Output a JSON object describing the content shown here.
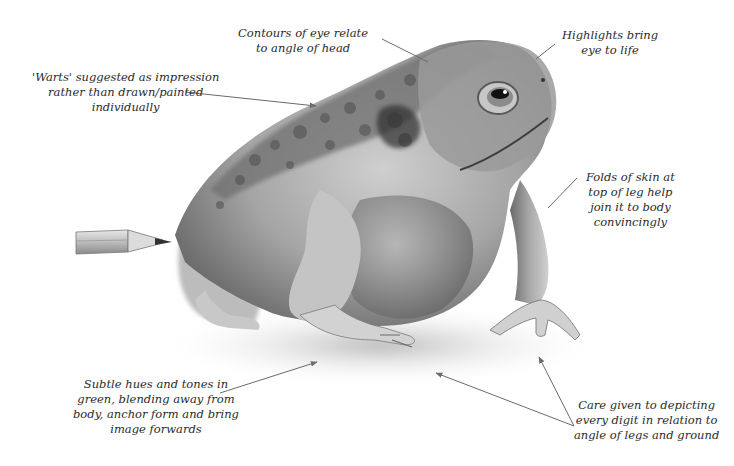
{
  "annotations": {
    "eye_contours": {
      "lines": [
        "Contours of eye relate",
        "to angle of head"
      ]
    },
    "highlights": {
      "lines": [
        "Highlights bring",
        "eye to life"
      ]
    },
    "warts": {
      "lines": [
        "'Warts' suggested as impression",
        "rather than drawn/painted",
        "individually"
      ]
    },
    "skin_folds": {
      "lines": [
        "Folds of skin at",
        "top of leg help",
        "join it to body",
        "convincingly"
      ]
    },
    "subtle_hues": {
      "lines": [
        "Subtle hues and tones in",
        "green, blending away from",
        "body, anchor form and bring",
        "image forwards"
      ]
    },
    "digits": {
      "lines": [
        "Care given to depicting",
        "every digit in relation to",
        "angle of legs and ground"
      ]
    }
  },
  "colors": {
    "background": "#ffffff",
    "text": "#2b2b2b",
    "leader_line": "#6a6a6a",
    "toad_dark": "#3a3a3a",
    "toad_mid": "#8a8a8a",
    "toad_light": "#d6d6d6"
  }
}
